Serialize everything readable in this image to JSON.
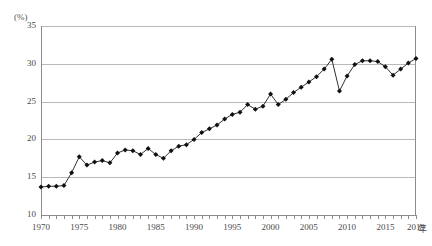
{
  "chart_data": {
    "type": "line",
    "title": "",
    "subtitle": "",
    "xlabel": "年",
    "ylabel": "(%)",
    "unit_label": "(%)",
    "x_axis_unit": "年",
    "ylim": [
      10,
      35
    ],
    "xlim": [
      1970,
      2019
    ],
    "ytick_labels": [
      "35",
      "30",
      "25",
      "20",
      "15",
      "10"
    ],
    "yticks": [
      35,
      30,
      25,
      20,
      15,
      10
    ],
    "xtick_labels": [
      "1970",
      "1975",
      "1980",
      "1985",
      "1990",
      "1995",
      "2000",
      "2005",
      "2010",
      "2015",
      "2019"
    ],
    "xticks": [
      1970,
      1975,
      1980,
      1985,
      1990,
      1995,
      2000,
      2005,
      2010,
      2015,
      2019
    ],
    "grid": true,
    "legend": "none",
    "marker": "diamond",
    "line_color": "#1a1a1a",
    "marker_color": "#111111",
    "grid_color": "#b9b9b9",
    "axis_color": "#8c8c8c",
    "x": [
      1970,
      1971,
      1972,
      1973,
      1974,
      1975,
      1976,
      1977,
      1978,
      1979,
      1980,
      1981,
      1982,
      1983,
      1984,
      1985,
      1986,
      1987,
      1988,
      1989,
      1990,
      1991,
      1992,
      1993,
      1994,
      1995,
      1996,
      1997,
      1998,
      1999,
      2000,
      2001,
      2002,
      2003,
      2004,
      2005,
      2006,
      2007,
      2008,
      2009,
      2010,
      2011,
      2012,
      2013,
      2014,
      2015,
      2016,
      2017,
      2018,
      2019
    ],
    "values": [
      13.7,
      13.8,
      13.8,
      13.9,
      15.6,
      17.7,
      16.6,
      17.0,
      17.2,
      16.9,
      18.2,
      18.6,
      18.5,
      18.0,
      18.8,
      18.0,
      17.5,
      18.5,
      19.1,
      19.3,
      20.0,
      20.9,
      21.4,
      21.9,
      22.7,
      23.3,
      23.6,
      24.6,
      24.0,
      24.4,
      26.0,
      24.6,
      25.3,
      26.2,
      26.9,
      27.6,
      28.3,
      29.3,
      30.6,
      26.4,
      28.4,
      29.9,
      30.4,
      30.4,
      30.3,
      29.6,
      28.5,
      29.3,
      30.1,
      30.7
    ]
  }
}
